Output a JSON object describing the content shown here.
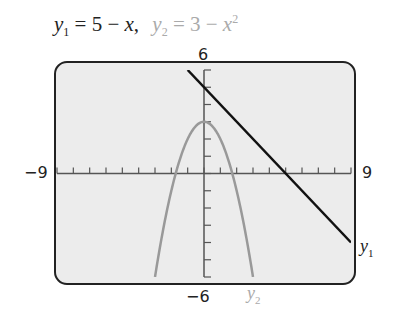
{
  "chart_data": {
    "type": "line",
    "xlabel": "",
    "ylabel": "",
    "xlim": [
      -9,
      9
    ],
    "ylim": [
      -6,
      6
    ],
    "grid": false,
    "x_tick_step": 1,
    "y_tick_step": 1,
    "window_labels": {
      "xmin": "−9",
      "xmax": "9",
      "ymin": "−6",
      "ymax": "6"
    },
    "series": [
      {
        "name": "y1",
        "equation": "y = 5 - x",
        "color": "#111111",
        "x": [
          -1,
          0,
          5,
          9
        ],
        "y": [
          6,
          5,
          0,
          -4
        ]
      },
      {
        "name": "y2",
        "equation": "y = 3 - x^2",
        "color": "#999999",
        "x": [
          -3,
          -2,
          -1.732,
          -1,
          0,
          1,
          1.732,
          2,
          3
        ],
        "y": [
          -6,
          -1,
          0,
          2,
          3,
          2,
          0,
          -1,
          -6
        ]
      }
    ]
  },
  "title": {
    "y1_lhs": "y",
    "y1_sub": "1",
    "y1_rhs": " = 5 − ",
    "y1_var": "x",
    "sep": ",",
    "y2_lhs": "y",
    "y2_sub": "2",
    "y2_rhs": " = 3 − ",
    "y2_var": "x",
    "y2_exp": "2"
  },
  "labels": {
    "ymax": "6",
    "ymin": "−6",
    "xmin": "−9",
    "xmax": "9",
    "curve1": "y",
    "curve1_sub": "1",
    "curve2": "y",
    "curve2_sub": "2"
  },
  "colors": {
    "frame_bg": "#ececec",
    "frame_border": "#222222",
    "line1": "#111111",
    "line2": "#999999"
  }
}
